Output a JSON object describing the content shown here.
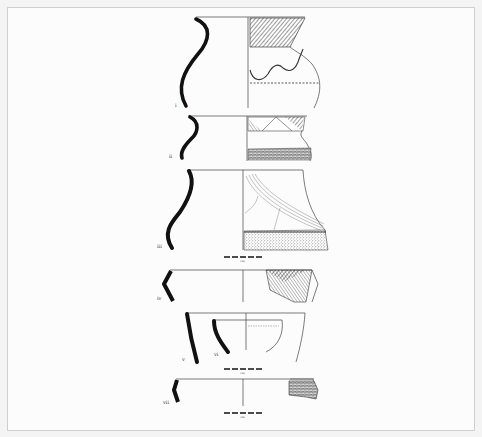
{
  "figure": {
    "type": "archaeological pottery profile drawings",
    "vessels": [
      {
        "id": "i",
        "label": "i"
      },
      {
        "id": "ii",
        "label": "ii"
      },
      {
        "id": "iii",
        "label": "iii"
      },
      {
        "id": "iv",
        "label": "iv"
      },
      {
        "id": "v",
        "label": "v"
      },
      {
        "id": "vi",
        "label": "vi"
      },
      {
        "id": "vii",
        "label": "vii"
      }
    ],
    "scale_bars": [
      {
        "label": "cm"
      },
      {
        "label": "cm"
      },
      {
        "label": "cm"
      }
    ]
  },
  "colors": {
    "ink": "#111111",
    "line": "#444444",
    "frame_border": "#cfcfcf",
    "background": "#fcfcfc"
  }
}
